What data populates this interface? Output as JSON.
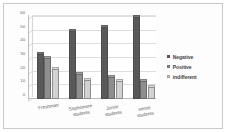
{
  "chart_data": {
    "type": "bar",
    "title": "",
    "subtitle": "",
    "xlabel": "",
    "ylabel": "",
    "categories": [
      "Freshman",
      "Sophomore students",
      "Junior students",
      "senior students"
    ],
    "series": [
      {
        "name": "Negative",
        "values": [
          33,
          50,
          53,
          60
        ],
        "color": "#595959"
      },
      {
        "name": "Positive",
        "values": [
          30,
          18,
          16,
          13
        ],
        "color": "#8e8e8e"
      },
      {
        "name": "indifferent",
        "values": [
          22,
          14,
          13,
          9
        ],
        "color": "#d2d2d2"
      }
    ],
    "ylim": [
      0,
      60
    ],
    "yticks": [
      0,
      10,
      20,
      30,
      40,
      50,
      60
    ],
    "ytick_labels": [
      "0",
      "10",
      "20",
      "30",
      "40",
      "50",
      "60"
    ],
    "grid": true,
    "legend_position": "right",
    "style": "3d-column"
  },
  "axis": {
    "y_tick_labels": [
      "60",
      "50",
      "40",
      "30",
      "20",
      "10",
      "0"
    ]
  },
  "categories": [
    {
      "line1": "Freshman",
      "line2": ""
    },
    {
      "line1": "Sophomore",
      "line2": "students"
    },
    {
      "line1": "Junior",
      "line2": "students"
    },
    {
      "line1": "senior",
      "line2": "students"
    }
  ],
  "legend": {
    "items": [
      {
        "label": "Negative",
        "swatch": "legend-swatch-negative"
      },
      {
        "label": "Positive",
        "swatch": "legend-swatch-positive"
      },
      {
        "label": "indifferent",
        "swatch": "legend-swatch-indifferent"
      }
    ]
  }
}
